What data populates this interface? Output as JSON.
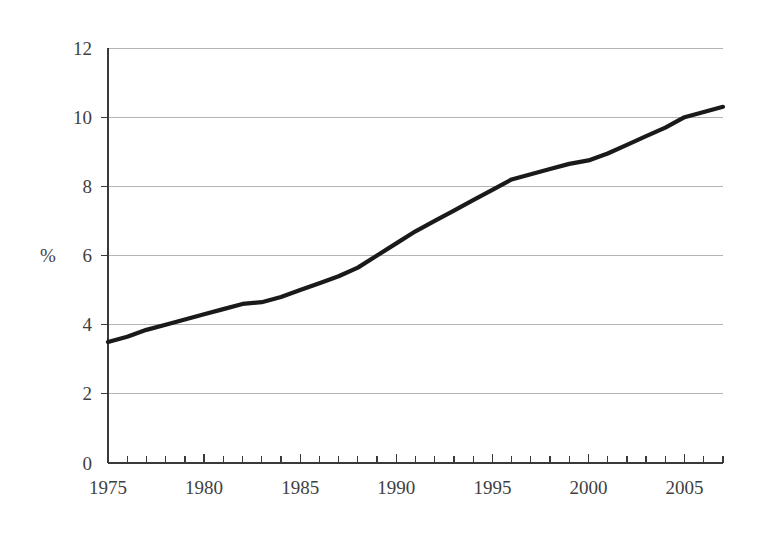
{
  "chart_data": {
    "type": "line",
    "title": "",
    "subtitle": "",
    "xlabel": "",
    "ylabel": "%",
    "ylabel_unit": "%",
    "xlim": [
      1975,
      2007
    ],
    "ylim": [
      0,
      12
    ],
    "y_ticks": [
      0,
      2,
      4,
      6,
      8,
      10,
      12
    ],
    "y_tick_labels": [
      "0",
      "2",
      "4",
      "6",
      "8",
      "10",
      "12"
    ],
    "x_ticks": [
      1975,
      1980,
      1985,
      1990,
      1995,
      2000,
      2005
    ],
    "x_tick_labels": [
      "1975",
      "1980",
      "1985",
      "1990",
      "1995",
      "2000",
      "2005"
    ],
    "x_minor_tick_step": 1,
    "grid": true,
    "grid_axis": "y",
    "legend": null,
    "legend_position": "none",
    "annotations": [],
    "colors": {
      "line": "#1a1a1a",
      "gridline": "#b4b4b4",
      "axis": "#3a3a3a",
      "text": "#3f3f3f",
      "background": "#ffffff"
    },
    "series": [
      {
        "name": "",
        "x": [
          1975,
          1976,
          1977,
          1978,
          1979,
          1980,
          1981,
          1982,
          1983,
          1984,
          1985,
          1986,
          1987,
          1988,
          1989,
          1990,
          1991,
          1992,
          1993,
          1994,
          1995,
          1996,
          1997,
          1998,
          1999,
          2000,
          2001,
          2002,
          2003,
          2004,
          2005,
          2006,
          2007
        ],
        "values": [
          3.5,
          3.65,
          3.85,
          4.0,
          4.15,
          4.3,
          4.45,
          4.6,
          4.65,
          4.8,
          5.0,
          5.2,
          5.4,
          5.65,
          6.0,
          6.35,
          6.7,
          7.0,
          7.3,
          7.6,
          7.9,
          8.2,
          8.35,
          8.5,
          8.65,
          8.75,
          8.95,
          9.2,
          9.45,
          9.7,
          10.0,
          10.15,
          10.3
        ]
      }
    ]
  },
  "axis": {
    "y_unit": "%"
  }
}
